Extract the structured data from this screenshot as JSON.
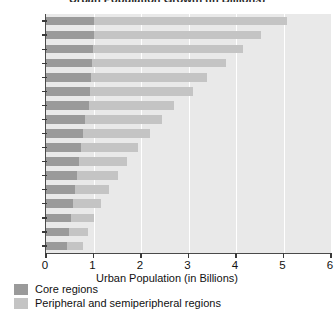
{
  "chart_data": {
    "type": "bar",
    "orientation": "horizontal",
    "stacked": true,
    "title": "Urban Population Growth (in Billions)",
    "xlabel": "Urban Population (in Billions)",
    "ylabel": "",
    "xlim": [
      0,
      6
    ],
    "xticks": [
      0,
      1,
      2,
      3,
      4,
      5,
      6
    ],
    "xtick_labels": [
      "0",
      "1",
      "2",
      "3",
      "4",
      "5",
      "6"
    ],
    "grid": true,
    "grid_axis": "x",
    "legend_position": "below",
    "categories": [
      "2030",
      "2025",
      "2020",
      "2015",
      "2010",
      "2005",
      "2000",
      "1995",
      "1990",
      "1985",
      "1980",
      "1975",
      "1970",
      "1965",
      "1960",
      "1955",
      "1950"
    ],
    "series": [
      {
        "name": "Core regions",
        "color": "#9a9a9a",
        "values": [
          1.0,
          1.0,
          0.98,
          0.96,
          0.94,
          0.92,
          0.9,
          0.82,
          0.78,
          0.74,
          0.7,
          0.66,
          0.62,
          0.56,
          0.52,
          0.48,
          0.45
        ]
      },
      {
        "name": "Peripheral and semiperipheral regions",
        "color": "#c4c4c4",
        "values": [
          4.07,
          3.53,
          3.17,
          2.82,
          2.46,
          2.18,
          1.8,
          1.63,
          1.42,
          1.19,
          1.01,
          0.86,
          0.71,
          0.6,
          0.49,
          0.4,
          0.33
        ]
      }
    ],
    "totals": [
      5.07,
      4.53,
      4.15,
      3.78,
      3.4,
      3.1,
      2.7,
      2.45,
      2.2,
      1.93,
      1.71,
      1.52,
      1.33,
      1.16,
      1.01,
      0.88,
      0.78
    ]
  },
  "axis": {
    "x_title": "Urban Population (in Billions)"
  },
  "legend": {
    "items": [
      {
        "label": "Core regions",
        "color": "#9a9a9a"
      },
      {
        "label": "Peripheral and semiperipheral regions",
        "color": "#c4c4c4"
      }
    ]
  },
  "colors": {
    "core": "#9a9a9a",
    "peripheral": "#c4c4c4",
    "plot_background": "#e9e9e9",
    "gridline": "#ffffff",
    "axis": "#3a3a3a"
  }
}
